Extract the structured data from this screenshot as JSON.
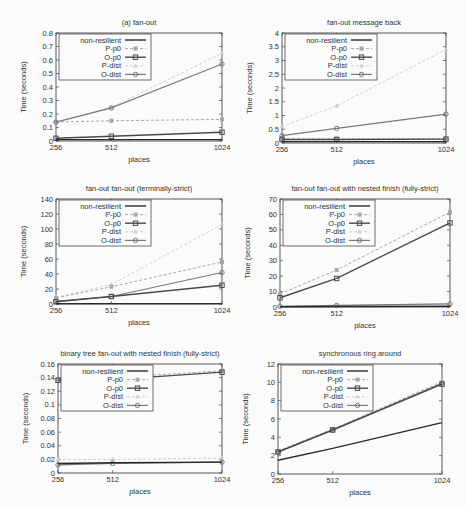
{
  "figure": {
    "legend_labels": [
      "non-resilient",
      "P-p0",
      "O-p0",
      "P-dist",
      "O-dist"
    ],
    "series_styles": {
      "non-resilient": {
        "color": "#2a2a2a",
        "dash": "",
        "marker": "none",
        "width": 1.4
      },
      "P-p0": {
        "color": "#a8a8a8",
        "dash": "3,2",
        "marker": "filled-square",
        "width": 1
      },
      "O-p0": {
        "color": "#4a4a4a",
        "dash": "",
        "marker": "open-square",
        "width": 1.4
      },
      "P-dist": {
        "color": "#cfcfcf",
        "dash": "3,2",
        "marker": "triangle",
        "width": 1
      },
      "O-dist": {
        "color": "#7a7a7a",
        "dash": "",
        "marker": "circle",
        "width": 1.2
      }
    }
  },
  "chart_data": [
    {
      "type": "line",
      "title": "(a) fan-out",
      "xlabel": "places",
      "ylabel": "Time (seconds)",
      "categories": [
        "256",
        "512",
        "1024"
      ],
      "x": [
        256,
        512,
        1024
      ],
      "ylim": [
        0,
        0.8
      ],
      "yticks": [
        "0",
        "0.1",
        "0.2",
        "0.3",
        "0.4",
        "0.5",
        "0.6",
        "0.7",
        "0.8"
      ],
      "legend_position": "top-left",
      "series": [
        {
          "name": "non-resilient",
          "values": [
            0.01,
            0.01,
            0.01
          ]
        },
        {
          "name": "P-p0",
          "values": [
            0.14,
            0.15,
            0.16
          ]
        },
        {
          "name": "O-p0",
          "values": [
            0.02,
            0.035,
            0.065
          ]
        },
        {
          "name": "P-dist",
          "values": [
            0.14,
            0.25,
            0.65
          ]
        },
        {
          "name": "O-dist",
          "values": [
            0.14,
            0.245,
            0.57
          ]
        }
      ]
    },
    {
      "type": "line",
      "title": "fan-out message back",
      "xlabel": "places",
      "ylabel": "Time (seconds)",
      "categories": [
        "256",
        "512",
        "1024"
      ],
      "x": [
        256,
        512,
        1024
      ],
      "ylim": [
        0,
        4
      ],
      "yticks": [
        "0",
        "0.5",
        "1",
        "1.5",
        "2",
        "2.5",
        "3",
        "3.5",
        "4"
      ],
      "legend_position": "top-left",
      "series": [
        {
          "name": "non-resilient",
          "values": [
            0.05,
            0.05,
            0.05
          ]
        },
        {
          "name": "P-p0",
          "values": [
            0.15,
            0.15,
            0.15
          ]
        },
        {
          "name": "O-p0",
          "values": [
            0.13,
            0.13,
            0.14
          ]
        },
        {
          "name": "P-dist",
          "values": [
            0.6,
            1.35,
            3.4
          ]
        },
        {
          "name": "O-dist",
          "values": [
            0.27,
            0.53,
            1.05
          ]
        }
      ]
    },
    {
      "type": "line",
      "title": "fan-out fan-out (terminally-strict)",
      "xlabel": "places",
      "ylabel": "Time (seconds)",
      "categories": [
        "256",
        "512",
        "1024"
      ],
      "x": [
        256,
        512,
        1024
      ],
      "ylim": [
        0,
        140
      ],
      "yticks": [
        "0",
        "20",
        "40",
        "60",
        "80",
        "100",
        "120",
        "140"
      ],
      "legend_position": "top-left",
      "series": [
        {
          "name": "non-resilient",
          "values": [
            0.5,
            0.5,
            0.5
          ]
        },
        {
          "name": "P-p0",
          "values": [
            8,
            23,
            56
          ]
        },
        {
          "name": "O-p0",
          "values": [
            3,
            10,
            25
          ]
        },
        {
          "name": "P-dist",
          "values": [
            9,
            26,
            106
          ]
        },
        {
          "name": "O-dist",
          "values": [
            3.5,
            10,
            42
          ]
        }
      ]
    },
    {
      "type": "line",
      "title": "fan-out fan-out with nested finish (fully-strict)",
      "xlabel": "places",
      "ylabel": "Time (seconds)",
      "categories": [
        "256",
        "512",
        "1024"
      ],
      "x": [
        256,
        512,
        1024
      ],
      "ylim": [
        0,
        70
      ],
      "yticks": [
        "0",
        "10",
        "20",
        "30",
        "40",
        "50",
        "60",
        "70"
      ],
      "legend_position": "top-left",
      "series": [
        {
          "name": "non-resilient",
          "values": [
            0.2,
            0.3,
            0.5
          ]
        },
        {
          "name": "P-p0",
          "values": [
            8.5,
            24,
            61.5
          ]
        },
        {
          "name": "O-p0",
          "values": [
            6,
            18.5,
            54.5
          ]
        },
        {
          "name": "P-dist",
          "values": [
            0.5,
            1,
            2
          ]
        },
        {
          "name": "O-dist",
          "values": [
            0.5,
            1,
            2
          ]
        }
      ]
    },
    {
      "type": "line",
      "title": "binary tree fan-out with nested finish (fully-strict)",
      "xlabel": "places",
      "ylabel": "Time (seconds)",
      "categories": [
        "256",
        "512",
        "1024"
      ],
      "x": [
        256,
        512,
        1024
      ],
      "ylim": [
        0,
        0.16
      ],
      "yticks": [
        "0",
        "0.02",
        "0.04",
        "0.06",
        "0.08",
        "0.1",
        "0.12",
        "0.14",
        "0.16"
      ],
      "legend_position": "top-left",
      "series": [
        {
          "name": "non-resilient",
          "values": [
            0.014,
            0.015,
            0.016
          ]
        },
        {
          "name": "P-p0",
          "values": [
            0.137,
            0.14,
            0.15
          ]
        },
        {
          "name": "O-p0",
          "values": [
            0.136,
            0.137,
            0.148
          ]
        },
        {
          "name": "P-dist",
          "values": [
            0.02,
            0.02,
            0.022
          ]
        },
        {
          "name": "O-dist",
          "values": [
            0.012,
            0.014,
            0.016
          ]
        }
      ]
    },
    {
      "type": "line",
      "title": "synchronous ring around",
      "xlabel": "places",
      "ylabel": "Time (seconds)",
      "categories": [
        "256",
        "512",
        "1024"
      ],
      "x": [
        256,
        512,
        1024
      ],
      "ylim": [
        0,
        12
      ],
      "yticks": [
        "0",
        "2",
        "4",
        "6",
        "8",
        "10",
        "12"
      ],
      "legend_position": "top-left",
      "series": [
        {
          "name": "non-resilient",
          "values": [
            1.5,
            2.8,
            5.6
          ]
        },
        {
          "name": "P-p0",
          "values": [
            2.5,
            4.9,
            10
          ]
        },
        {
          "name": "O-p0",
          "values": [
            2.4,
            4.8,
            9.8
          ]
        },
        {
          "name": "P-dist",
          "values": [
            2.5,
            4.9,
            10.1
          ]
        },
        {
          "name": "O-dist",
          "values": [
            2.4,
            4.8,
            9.9
          ]
        }
      ]
    }
  ]
}
